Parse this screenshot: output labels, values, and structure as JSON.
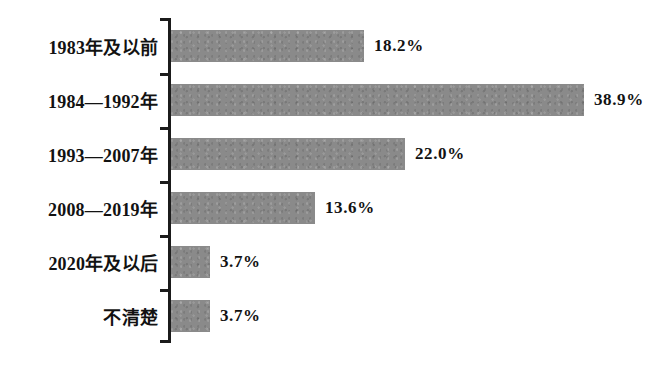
{
  "chart_data": {
    "type": "bar",
    "orientation": "horizontal",
    "title": "",
    "subtitle": "",
    "xlabel": "",
    "ylabel": "",
    "grid": false,
    "legend": false,
    "legend_position": "none",
    "xlim": [
      0,
      38.9
    ],
    "value_suffix": "%",
    "series_name": "",
    "bar_color": "#8a8a8a",
    "axis_color": "#1b1b1b",
    "text_color": "#121212",
    "background": "#ffffff",
    "categories": [
      "1983年及以前",
      "1984—1992年",
      "1993—2007年",
      "2008—2019年",
      "2020年及以后",
      "不清楚"
    ],
    "values": [
      18.2,
      38.9,
      22.0,
      13.6,
      3.7,
      3.7
    ],
    "value_labels": [
      "18.2%",
      "38.9%",
      "22.0%",
      "13.6%",
      "3.7%",
      "3.7%"
    ],
    "bars": [
      {
        "category": "1983年及以前",
        "value": 18.2,
        "label": "18.2%"
      },
      {
        "category": "1984—1992年",
        "value": 38.9,
        "label": "38.9%"
      },
      {
        "category": "1993—2007年",
        "value": 22.0,
        "label": "22.0%"
      },
      {
        "category": "2008—2019年",
        "value": 13.6,
        "label": "13.6%"
      },
      {
        "category": "2020年及以后",
        "value": 3.7,
        "label": "3.7%"
      },
      {
        "category": "不清楚",
        "value": 3.7,
        "label": "3.7%"
      }
    ]
  }
}
